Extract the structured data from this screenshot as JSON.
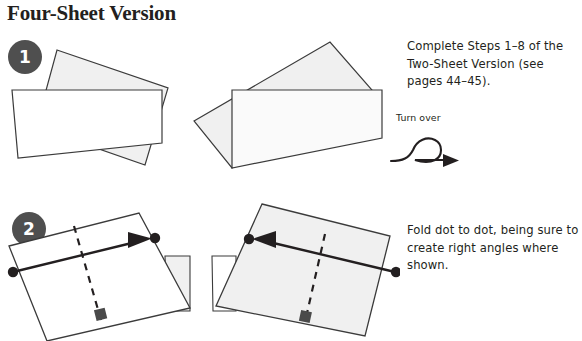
{
  "page": {
    "title": "Four-Sheet Version",
    "background_color": "#ffffff",
    "width": 582,
    "height": 341
  },
  "style": {
    "badge_fill": "#4f4f4f",
    "badge_text_color": "#ffffff",
    "paper_fill_gray": "#f0f0f0",
    "paper_fill_white": "#ffffff",
    "outline_color": "#3b3b3b",
    "ink_color": "#231f20",
    "marker_fill": "#4a4a4a"
  },
  "steps": [
    {
      "number": "1",
      "badge_name": "step-1-badge",
      "instruction": "Complete Steps 1–8 of the Two-Sheet Version (see pages 44–45).",
      "figures": [
        {
          "name": "step-1-figure-left",
          "description": "tilted gray sheet behind a white rectangular sheet"
        },
        {
          "name": "step-1-figure-right",
          "description": "mirrored tilted sheet with white sheet in front"
        }
      ],
      "aside": {
        "label": "Turn over",
        "icon": "turn-over-loop-arrow-icon"
      }
    },
    {
      "number": "2",
      "badge_name": "step-2-badge",
      "instruction": "Fold dot to dot, being sure to create right angles where shown.",
      "figures": [
        {
          "name": "step-2-figure-left",
          "description": "white sheet with arrow pointing up-right from dot to dot, dashed fold line and right-angle marker"
        },
        {
          "name": "step-2-figure-right",
          "description": "gray sheet with arrow pointing left from dot to dot, dashed fold line and right-angle marker"
        }
      ]
    }
  ]
}
